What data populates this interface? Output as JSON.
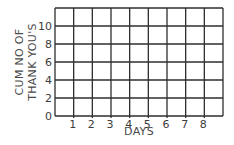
{
  "chart_data": {
    "type": "line",
    "title": "",
    "xlabel": "DAYS",
    "ylabel_lines": [
      "CUM NO OF",
      "THANK YOU'S"
    ],
    "ylabel": "CUM NO OF THANK YOU'S",
    "x_ticks": [
      "1",
      "2",
      "3",
      "4",
      "5",
      "6",
      "7",
      "8"
    ],
    "y_ticks": [
      "0",
      "2",
      "4",
      "6",
      "8",
      "10"
    ],
    "xlim": [
      0,
      9
    ],
    "ylim": [
      0,
      12
    ],
    "grid": true,
    "grid_columns": 9,
    "grid_rows": 6,
    "series": [],
    "legend": null,
    "colors": {
      "grid": "#2e2e2e",
      "text": "#3c3c3c"
    }
  }
}
